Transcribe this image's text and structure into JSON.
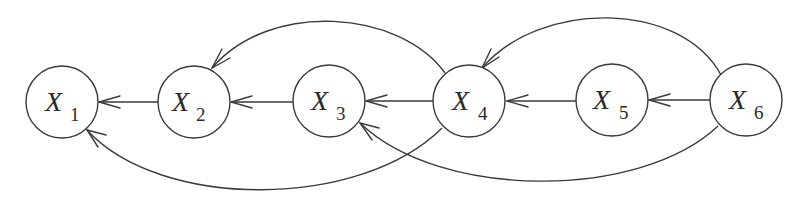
{
  "diagram": {
    "type": "directed-graph",
    "nodes": [
      {
        "id": "X1",
        "letter": "X",
        "subscript": "1",
        "cx": 62,
        "cy": 102
      },
      {
        "id": "X2",
        "letter": "X",
        "subscript": "2",
        "cx": 194,
        "cy": 102
      },
      {
        "id": "X3",
        "letter": "X",
        "subscript": "3",
        "cx": 329,
        "cy": 101
      },
      {
        "id": "X4",
        "letter": "X",
        "subscript": "4",
        "cx": 469,
        "cy": 101
      },
      {
        "id": "X5",
        "letter": "X",
        "subscript": "5",
        "cx": 612,
        "cy": 100
      },
      {
        "id": "X6",
        "letter": "X",
        "subscript": "6",
        "cx": 746,
        "cy": 100
      }
    ],
    "node_radius": 36,
    "edges": [
      {
        "from": "X2",
        "to": "X1",
        "shape": "straight"
      },
      {
        "from": "X3",
        "to": "X2",
        "shape": "straight"
      },
      {
        "from": "X4",
        "to": "X3",
        "shape": "straight"
      },
      {
        "from": "X5",
        "to": "X4",
        "shape": "straight"
      },
      {
        "from": "X6",
        "to": "X5",
        "shape": "straight"
      },
      {
        "from": "X4",
        "to": "X2",
        "shape": "arc-above"
      },
      {
        "from": "X6",
        "to": "X4",
        "shape": "arc-above"
      },
      {
        "from": "X4",
        "to": "X1",
        "shape": "arc-below"
      },
      {
        "from": "X6",
        "to": "X3",
        "shape": "arc-below"
      }
    ],
    "colors": {
      "stroke": "#3a3a3a",
      "background": "#ffffff",
      "text": "#2a2a2a"
    }
  }
}
